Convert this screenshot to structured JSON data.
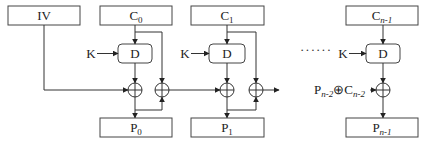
{
  "diagram": {
    "type": "CBC-style decryption chain (PCBC decryption)",
    "blocks": {
      "iv": {
        "label": "IV"
      },
      "c0": {
        "label": "C",
        "sub": "0"
      },
      "c1": {
        "label": "C",
        "sub": "1"
      },
      "cn1": {
        "label": "C",
        "sub": "n-1"
      },
      "p0": {
        "label": "P",
        "sub": "0"
      },
      "p1": {
        "label": "P",
        "sub": "1"
      },
      "pn1": {
        "label": "P",
        "sub": "n-1"
      }
    },
    "decrypt": {
      "d0": {
        "label": "D"
      },
      "d1": {
        "label": "D"
      },
      "dn1": {
        "label": "D"
      }
    },
    "key": {
      "k0": "K",
      "k1": "K",
      "kn1": "K"
    },
    "chain_input": {
      "p": "P",
      "p_sub": "n-2",
      "xor_sym": "⊕",
      "c": "C",
      "c_sub": "n-2"
    },
    "ellipsis": "······"
  }
}
